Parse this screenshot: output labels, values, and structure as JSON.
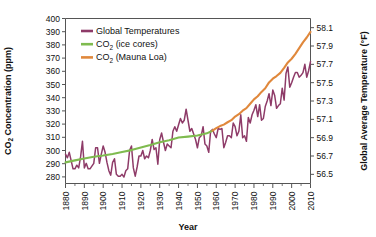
{
  "chart_data": {
    "type": "line",
    "title": "",
    "xlabel": "Year",
    "ylabel": "CO2 Concentration (ppm)",
    "ylabel_right": "Global Average Temperature (°F)",
    "xlim": [
      1880,
      2010
    ],
    "ylim": [
      275,
      400
    ],
    "ylim_right": [
      56.4,
      58.2
    ],
    "grid": false,
    "legend_position": "top-left",
    "xticks": [
      1880,
      1890,
      1900,
      1910,
      1920,
      1930,
      1940,
      1950,
      1960,
      1970,
      1980,
      1990,
      2000,
      2010
    ],
    "xtick_labels": [
      "1880",
      "1890",
      "1900",
      "1910",
      "1920",
      "1930",
      "1940",
      "1950",
      "1960",
      "1970",
      "1980",
      "1990",
      "2000",
      "2010"
    ],
    "x_minor_ticks": [
      1885,
      1895,
      1905,
      1915,
      1925,
      1935,
      1945,
      1955,
      1965,
      1975,
      1985,
      1995,
      2005
    ],
    "yticks": [
      280,
      290,
      300,
      310,
      320,
      330,
      340,
      350,
      360,
      370,
      380,
      390,
      400
    ],
    "ytick_labels": [
      "280",
      "290",
      "300",
      "310",
      "320",
      "330",
      "340",
      "350",
      "360",
      "370",
      "380",
      "390",
      "400"
    ],
    "yticks_right": [
      56.5,
      56.7,
      56.9,
      57.1,
      57.3,
      57.5,
      57.7,
      57.9,
      58.1
    ],
    "ytick_labels_right": [
      "56.5",
      "56.7",
      "56.9",
      "57.1",
      "57.3",
      "57.5",
      "57.7",
      "57.9",
      "58.1"
    ],
    "series": [
      {
        "name": "Global Temperatures",
        "color": "#8E3B68",
        "axis": "right",
        "x": [
          1880,
          1881,
          1882,
          1883,
          1884,
          1885,
          1886,
          1887,
          1888,
          1889,
          1890,
          1891,
          1892,
          1893,
          1894,
          1895,
          1896,
          1897,
          1898,
          1899,
          1900,
          1901,
          1902,
          1903,
          1904,
          1905,
          1906,
          1907,
          1908,
          1909,
          1910,
          1911,
          1912,
          1913,
          1914,
          1915,
          1916,
          1917,
          1918,
          1919,
          1920,
          1921,
          1922,
          1923,
          1924,
          1925,
          1926,
          1927,
          1928,
          1929,
          1930,
          1931,
          1932,
          1933,
          1934,
          1935,
          1936,
          1937,
          1938,
          1939,
          1940,
          1941,
          1942,
          1943,
          1944,
          1945,
          1946,
          1947,
          1948,
          1949,
          1950,
          1951,
          1952,
          1953,
          1954,
          1955,
          1956,
          1957,
          1958,
          1959,
          1960,
          1961,
          1962,
          1963,
          1964,
          1965,
          1966,
          1967,
          1968,
          1969,
          1970,
          1971,
          1972,
          1973,
          1974,
          1975,
          1976,
          1977,
          1978,
          1979,
          1980,
          1981,
          1982,
          1983,
          1984,
          1985,
          1986,
          1987,
          1988,
          1989,
          1990,
          1991,
          1992,
          1993,
          1994,
          1995,
          1996,
          1997,
          1998,
          1999,
          2000,
          2001,
          2002,
          2003,
          2004,
          2005,
          2006,
          2007,
          2008,
          2009,
          2010
        ],
        "values": [
          56.72,
          56.68,
          56.74,
          56.65,
          56.56,
          56.56,
          56.6,
          56.57,
          56.69,
          56.86,
          56.57,
          56.62,
          56.56,
          56.56,
          56.59,
          56.62,
          56.79,
          56.79,
          56.62,
          56.72,
          56.81,
          56.74,
          56.63,
          56.54,
          56.49,
          56.63,
          56.67,
          56.5,
          56.48,
          56.48,
          56.5,
          56.47,
          56.54,
          56.56,
          56.76,
          56.81,
          56.57,
          56.48,
          56.58,
          56.7,
          56.7,
          56.76,
          56.67,
          56.7,
          56.68,
          56.76,
          56.88,
          56.77,
          56.79,
          56.61,
          56.88,
          56.95,
          56.85,
          56.76,
          56.83,
          56.81,
          56.79,
          56.97,
          57.02,
          56.97,
          57.04,
          57.11,
          57.06,
          57.09,
          57.21,
          57.09,
          56.97,
          57.0,
          56.94,
          56.88,
          56.79,
          56.9,
          56.92,
          57.02,
          56.83,
          56.81,
          56.74,
          56.97,
          56.99,
          56.94,
          56.9,
          57.0,
          56.99,
          57.0,
          56.79,
          56.85,
          56.92,
          56.92,
          56.9,
          57.06,
          57.02,
          56.92,
          56.97,
          57.15,
          56.9,
          56.92,
          56.86,
          57.12,
          57.06,
          57.15,
          57.2,
          57.26,
          57.13,
          57.26,
          57.09,
          57.11,
          57.24,
          57.3,
          57.38,
          57.25,
          57.42,
          57.36,
          57.22,
          57.25,
          57.27,
          57.44,
          57.31,
          57.6,
          57.67,
          57.45,
          57.5,
          57.56,
          57.61,
          57.61,
          57.56,
          57.58,
          57.61,
          57.7,
          57.56,
          57.63,
          57.73
        ]
      },
      {
        "name": "CO2 (ice cores)",
        "color": "#7FBB4F",
        "axis": "left",
        "x": [
          1880,
          1885,
          1890,
          1895,
          1900,
          1905,
          1910,
          1915,
          1920,
          1925,
          1930,
          1935,
          1940,
          1945,
          1950,
          1955,
          1958
        ],
        "values": [
          291.0,
          292.5,
          294.0,
          295.3,
          296.2,
          297.4,
          298.8,
          300.3,
          302.3,
          304.2,
          306.3,
          307.8,
          309.8,
          310.5,
          311.3,
          313.0,
          315.0
        ]
      },
      {
        "name": "CO2 (Mauna Loa)",
        "color": "#E0883C",
        "axis": "left",
        "x": [
          1958,
          1960,
          1962,
          1964,
          1966,
          1968,
          1970,
          1972,
          1974,
          1976,
          1978,
          1980,
          1982,
          1984,
          1986,
          1988,
          1990,
          1992,
          1994,
          1996,
          1998,
          2000,
          2002,
          2004,
          2006,
          2008,
          2010
        ],
        "values": [
          315.0,
          316.9,
          318.5,
          319.6,
          321.4,
          323.0,
          325.7,
          327.5,
          330.2,
          332.1,
          335.4,
          338.7,
          341.1,
          344.4,
          347.2,
          351.6,
          354.4,
          356.4,
          358.8,
          362.6,
          366.7,
          369.5,
          373.2,
          377.5,
          381.9,
          385.6,
          389.9
        ]
      }
    ],
    "legend": [
      {
        "label": "Global Temperatures",
        "color": "#8E3B68"
      },
      {
        "label": "CO2 (ice cores)",
        "label_main": "CO",
        "label_sub": "2",
        "label_rest": " (ice cores)",
        "color": "#7FBB4F"
      },
      {
        "label": "CO2 (Mauna Loa)",
        "label_main": "CO",
        "label_sub": "2",
        "label_rest": " (Mauna Loa)",
        "color": "#E0883C"
      }
    ],
    "axis_left_title": {
      "main": "CO",
      "sub": "2",
      "rest": " Concentration (ppm)"
    },
    "axis_right_title": "Global Average Temperature (°F)"
  }
}
